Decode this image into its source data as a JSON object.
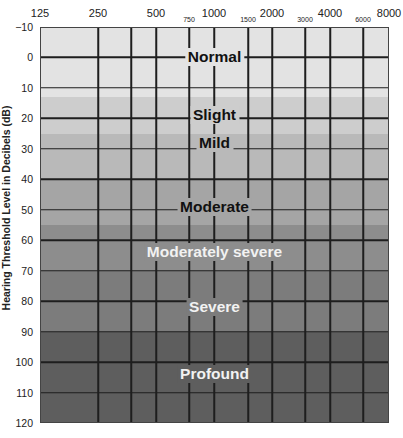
{
  "chart_data": {
    "type": "heatmap",
    "title": "",
    "subtitle": "Audiogram hearing loss degree bands",
    "xlabel": "Frequency (Hz)",
    "ylabel": "Hearing Threshold Level in Decibels (dB)",
    "x_ticks_major": [
      "125",
      "250",
      "500",
      "1000",
      "2000",
      "4000",
      "8000"
    ],
    "x_ticks_minor": [
      "750",
      "1500",
      "3000",
      "6000"
    ],
    "y_ticks": [
      "−10",
      "0",
      "10",
      "20",
      "30",
      "40",
      "50",
      "60",
      "70",
      "80",
      "90",
      "100",
      "110",
      "120"
    ],
    "ylim": [
      -10,
      120
    ],
    "y_inverted": true,
    "grid": true,
    "bands": [
      {
        "name": "Normal",
        "from_db": -10,
        "to_db": 13,
        "color": "#e3e3e3",
        "label_db": 0,
        "text_color": "dark"
      },
      {
        "name": "Slight",
        "from_db": 13,
        "to_db": 25,
        "color": "#cdcdcd",
        "label_db": 19,
        "text_color": "dark"
      },
      {
        "name": "Mild",
        "from_db": 25,
        "to_db": 40,
        "color": "#b9b9b9",
        "label_db": 28,
        "text_color": "dark"
      },
      {
        "name": "Moderate",
        "from_db": 40,
        "to_db": 55,
        "color": "#a5a5a5",
        "label_db": 49,
        "text_color": "dark"
      },
      {
        "name": "Moderately severe",
        "from_db": 55,
        "to_db": 70,
        "color": "#8d8d8d",
        "label_db": 64,
        "text_color": "light"
      },
      {
        "name": "Severe",
        "from_db": 70,
        "to_db": 90,
        "color": "#7c7c7c",
        "label_db": 82,
        "text_color": "light"
      },
      {
        "name": "Profound",
        "from_db": 90,
        "to_db": 120,
        "color": "#5e5e5e",
        "label_db": 104,
        "text_color": "light"
      }
    ]
  },
  "axis": {
    "ylabel": "Hearing Threshold Level in Decibels (dB)",
    "x_major": [
      {
        "label": "125",
        "x": 40
      },
      {
        "label": "250",
        "x": 98
      },
      {
        "label": "500",
        "x": 156
      },
      {
        "label": "1000",
        "x": 214
      },
      {
        "label": "2000",
        "x": 272
      },
      {
        "label": "4000",
        "x": 330
      },
      {
        "label": "8000",
        "x": 389
      }
    ],
    "x_minor": [
      {
        "label": "750",
        "x": 189
      },
      {
        "label": "1500",
        "x": 248
      },
      {
        "label": "3000",
        "x": 305
      },
      {
        "label": "6000",
        "x": 363
      }
    ],
    "extra_vlines": [
      131
    ]
  }
}
